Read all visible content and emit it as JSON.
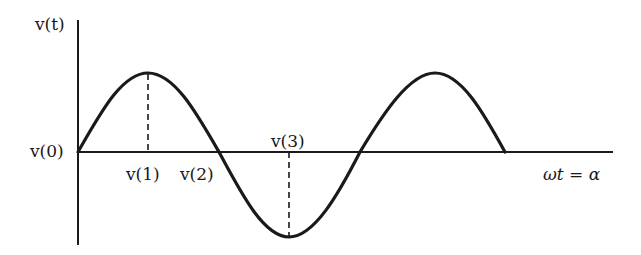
{
  "figure": {
    "y_axis_label": "v(t)",
    "x_axis_label": "ωt = α",
    "points": [
      {
        "id": "v0",
        "label": "v(0)"
      },
      {
        "id": "v1",
        "label": "v(1)"
      },
      {
        "id": "v2",
        "label": "v(2)"
      },
      {
        "id": "v3",
        "label": "v(3)"
      }
    ],
    "curve": "sine wave, 1.5 periods",
    "stroke_color": "#1a1a1a"
  }
}
